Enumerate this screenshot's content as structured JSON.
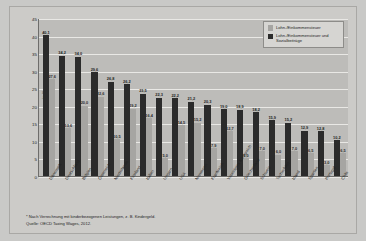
{
  "chart_data": {
    "type": "bar",
    "title": "",
    "xlabel": "",
    "ylabel": "in %",
    "ylim": [
      0,
      45
    ],
    "yticks": [
      "0",
      "5",
      "10",
      "15",
      "20",
      "25",
      "30",
      "35",
      "40",
      "45"
    ],
    "grid": true,
    "legend_position": "top-right",
    "categories": [
      "Dänemark",
      "Deutschland",
      "Belgien",
      "Österreich",
      "Niederlande",
      "Finnland",
      "Italien",
      "Ungarn",
      "USA",
      "Norwegen",
      "Frankreich",
      "Vereinigtes Königreich",
      "Griechenland",
      "Schweiz",
      "Tschechien",
      "Irland",
      "Spanien",
      "Portugal",
      "Chile"
    ],
    "series": [
      {
        "name": "Lohn-/Einkommensteuer und Sozialbeiträge",
        "color": "#2b2b2b",
        "values": [
          40.1,
          34.2,
          34.0,
          29.6,
          26.8,
          26.2,
          23.5,
          22.3,
          22.2,
          21.2,
          20.3,
          19.0,
          18.9,
          18.2,
          15.9,
          15.2,
          12.9,
          12.8,
          10.2
        ],
        "labels": [
          "40,1",
          "34,2",
          "34,0",
          "29,6",
          "26,8",
          "26,2",
          "23,5",
          "22,3",
          "22,2",
          "21,2",
          "20,3",
          "19,0",
          "18,9",
          "18,2",
          "15,9",
          "15,2",
          "12,9",
          "12,8",
          "10,2"
        ]
      },
      {
        "name": "Lohn-/Einkommensteuer",
        "color": "#a6a5a2",
        "values": [
          27.6,
          13.6,
          20.0,
          22.6,
          10.5,
          19.2,
          16.4,
          5.0,
          14.5,
          15.2,
          7.9,
          12.7,
          5.0,
          7.0,
          6.0,
          7.0,
          6.5,
          3.0,
          6.5
        ],
        "labels": [
          "27,6",
          "13,6",
          "20,0",
          "22,6",
          "10,5",
          "19,2",
          "16,4",
          "5,0",
          "14,5",
          "15,2",
          "7,9",
          "12,7",
          "5,0",
          "7,0",
          "6,0",
          "7,0",
          "6,5",
          "3,0",
          "6,5"
        ]
      }
    ]
  },
  "legend": {
    "items": [
      {
        "label": "Lohn-/Einkommensteuer"
      },
      {
        "label": "Lohn-/Einkommensteuer und Sozialbeiträge"
      }
    ]
  },
  "footnotes": {
    "marker": "*",
    "note": "Nach Verrechnung mit kinderbezogenen Leistungen, z. B. Kindergeld.",
    "source": "Quelle: OECD Taxing Wages, 2012."
  }
}
